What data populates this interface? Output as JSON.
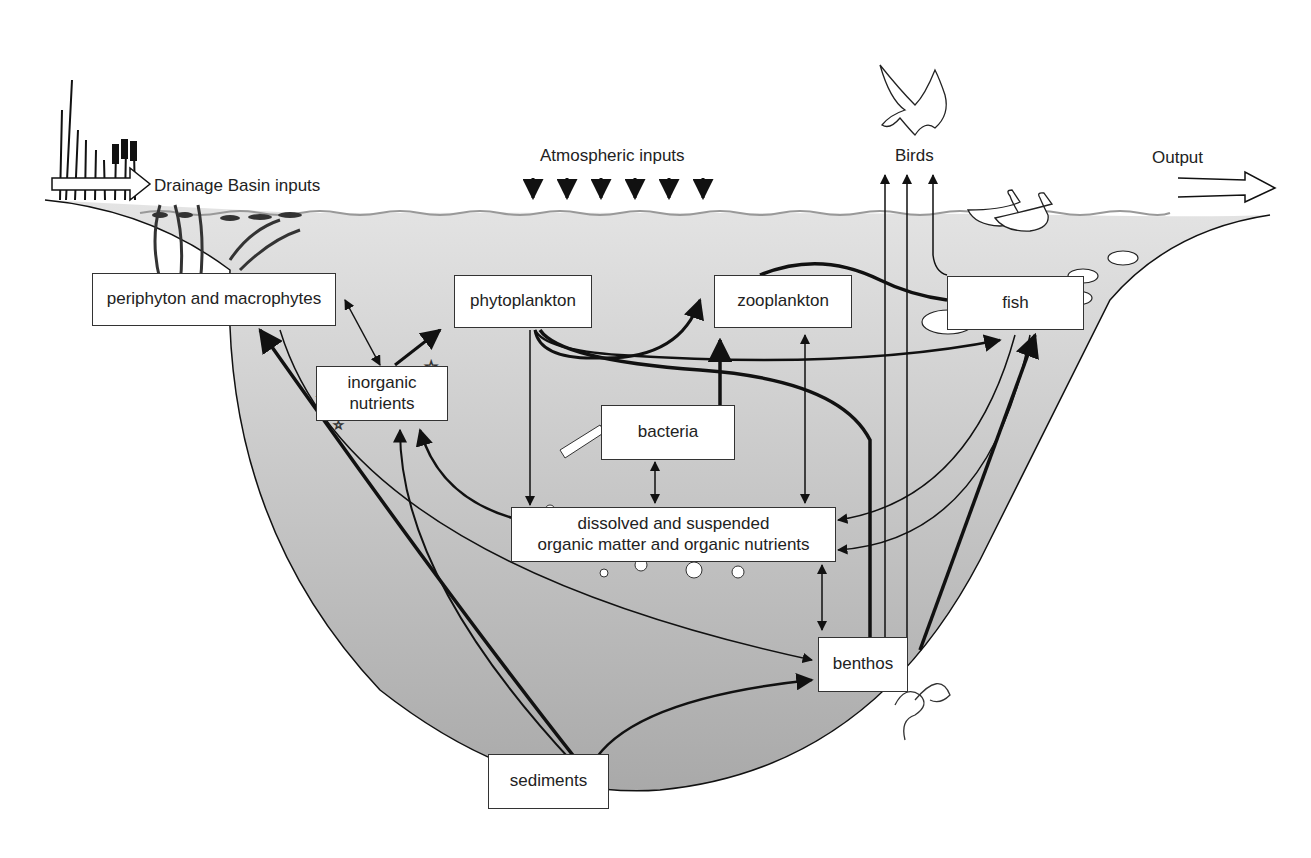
{
  "diagram": {
    "type": "lake ecosystem food web / nutrient flow",
    "external_labels": {
      "drainage": "Drainage Basin inputs",
      "atmospheric": "Atmospheric inputs",
      "birds": "Birds",
      "output": "Output"
    },
    "nodes": {
      "periphyton": "periphyton and macrophytes",
      "phytoplankton": "phytoplankton",
      "zooplankton": "zooplankton",
      "fish": "fish",
      "inorganic_line1": "inorganic",
      "inorganic_line2": "nutrients",
      "bacteria": "bacteria",
      "dom_line1": "dissolved and suspended",
      "dom_line2": "organic matter and organic nutrients",
      "benthos": "benthos",
      "sediments": "sediments"
    },
    "edges": [
      {
        "from": "periphyton",
        "to": "inorganic nutrients",
        "bidirectional": true
      },
      {
        "from": "inorganic nutrients",
        "to": "phytoplankton"
      },
      {
        "from": "phytoplankton",
        "to": "zooplankton"
      },
      {
        "from": "phytoplankton",
        "to": "fish"
      },
      {
        "from": "phytoplankton",
        "to": "dissolved and suspended organic matter"
      },
      {
        "from": "phytoplankton",
        "to": "benthos"
      },
      {
        "from": "zooplankton",
        "to": "fish"
      },
      {
        "from": "bacteria",
        "to": "zooplankton"
      },
      {
        "from": "bacteria",
        "to": "dissolved and suspended organic matter",
        "bidirectional": true
      },
      {
        "from": "zooplankton",
        "to": "dissolved and suspended organic matter",
        "bidirectional": true
      },
      {
        "from": "dissolved and suspended organic matter",
        "to": "inorganic nutrients"
      },
      {
        "from": "dissolved and suspended organic matter",
        "to": "benthos",
        "bidirectional": true
      },
      {
        "from": "fish",
        "to": "dissolved and suspended organic matter"
      },
      {
        "from": "fish",
        "to": "Birds"
      },
      {
        "from": "benthos",
        "to": "Birds"
      },
      {
        "from": "benthos",
        "to": "fish"
      },
      {
        "from": "periphyton",
        "to": "benthos"
      },
      {
        "from": "sediments",
        "to": "periphyton"
      },
      {
        "from": "sediments",
        "to": "inorganic nutrients"
      },
      {
        "from": "sediments",
        "to": "benthos"
      }
    ]
  }
}
